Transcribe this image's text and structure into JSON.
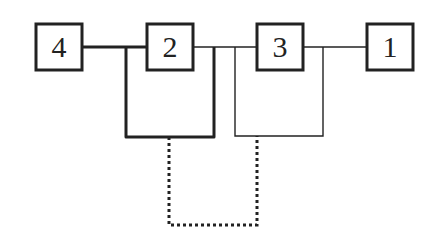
{
  "diagram": {
    "type": "network-topology",
    "nodes": [
      {
        "id": "4",
        "label": "4",
        "x": 36,
        "y": 24,
        "w": 46,
        "h": 46
      },
      {
        "id": "2",
        "label": "2",
        "x": 147,
        "y": 24,
        "w": 46,
        "h": 46
      },
      {
        "id": "3",
        "label": "3",
        "x": 257,
        "y": 24,
        "w": 46,
        "h": 46
      },
      {
        "id": "1",
        "label": "1",
        "x": 367,
        "y": 24,
        "w": 46,
        "h": 46
      }
    ],
    "connections": [
      {
        "from": "4",
        "to": "2",
        "style": "thick"
      },
      {
        "from": "2",
        "to": "3",
        "style": "thin"
      },
      {
        "from": "3",
        "to": "1",
        "style": "thin"
      },
      {
        "name": "loop-around-2",
        "style": "thick"
      },
      {
        "name": "loop-around-3",
        "style": "thin"
      },
      {
        "name": "dotted-link-between-loops",
        "style": "dotted"
      }
    ],
    "colors": {
      "stroke": "#222222",
      "background": "#ffffff"
    }
  }
}
